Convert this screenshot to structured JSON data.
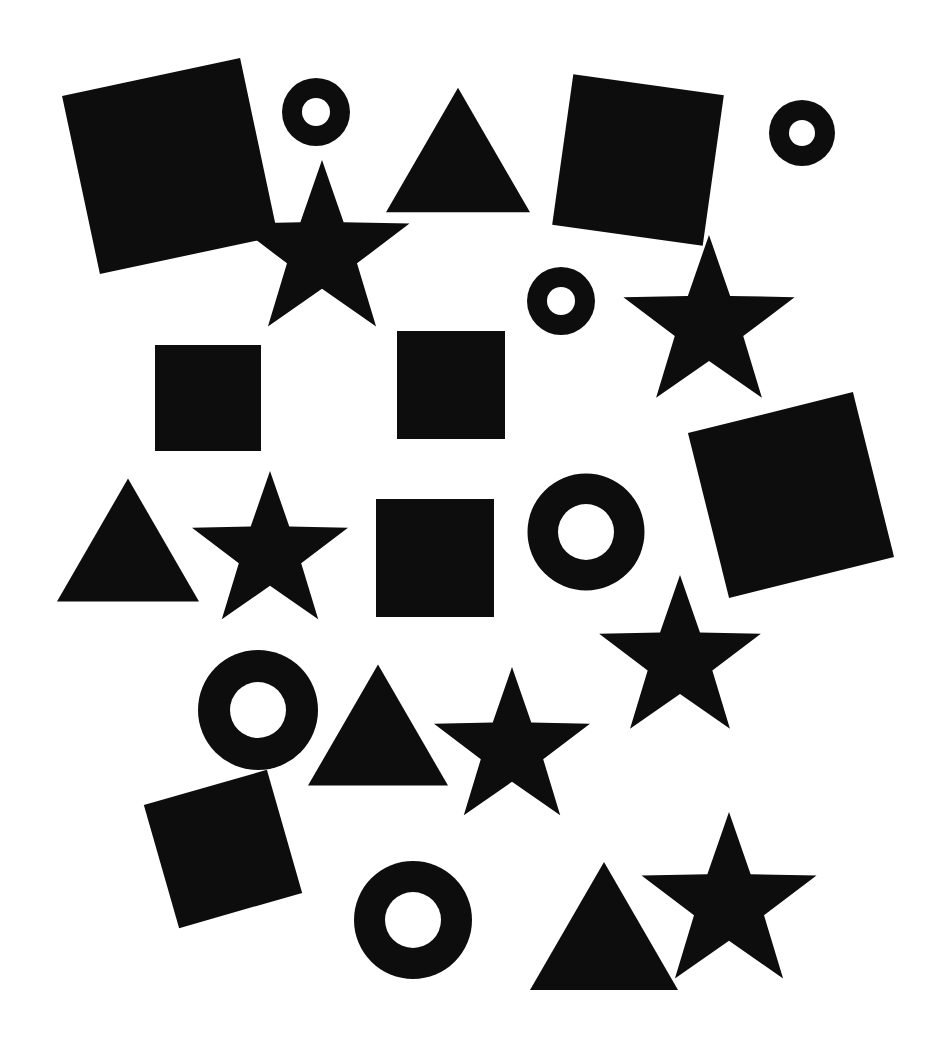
{
  "canvas": {
    "width": 936,
    "height": 1041,
    "background_color": "#ffffff",
    "shape_color": "#0d0d0d",
    "title": "Black geometric shapes on white background"
  },
  "legend": {
    "shape_kinds": [
      "square",
      "circle",
      "triangle",
      "star"
    ],
    "counts": {
      "square": 6,
      "circle": 6,
      "triangle": 4,
      "star": 6,
      "total": 22
    }
  },
  "shapes": [
    {
      "id": 1,
      "kind": "square",
      "label": "square-1",
      "cx": 170,
      "cy": 166,
      "size": 182,
      "rotation": -12,
      "color": "#0d0d0d"
    },
    {
      "id": 2,
      "kind": "circle",
      "label": "circle-1",
      "cx": 316,
      "cy": 112,
      "outer_d": 68,
      "inner_d": 28,
      "rotation": 0,
      "color": "#0d0d0d"
    },
    {
      "id": 3,
      "kind": "triangle",
      "label": "triangle-1",
      "cx": 458,
      "cy": 150,
      "size": 144,
      "rotation": 0,
      "color": "#0d0d0d"
    },
    {
      "id": 4,
      "kind": "square",
      "label": "square-2",
      "cx": 638,
      "cy": 160,
      "size": 152,
      "rotation": 8,
      "color": "#0d0d0d"
    },
    {
      "id": 5,
      "kind": "circle",
      "label": "circle-2",
      "cx": 802,
      "cy": 133,
      "outer_d": 66,
      "inner_d": 26,
      "rotation": 0,
      "color": "#0d0d0d"
    },
    {
      "id": 6,
      "kind": "star",
      "label": "star-1",
      "cx": 322,
      "cy": 252,
      "size": 92,
      "rotation": 0,
      "color": "#0d0d0d"
    },
    {
      "id": 7,
      "kind": "circle",
      "label": "circle-3",
      "cx": 561,
      "cy": 301,
      "outer_d": 68,
      "inner_d": 28,
      "rotation": 0,
      "color": "#0d0d0d"
    },
    {
      "id": 8,
      "kind": "star",
      "label": "star-2",
      "cx": 709,
      "cy": 325,
      "size": 90,
      "rotation": 0,
      "color": "#0d0d0d"
    },
    {
      "id": 9,
      "kind": "square",
      "label": "square-3",
      "cx": 208,
      "cy": 398,
      "size": 106,
      "rotation": 0,
      "color": "#0d0d0d"
    },
    {
      "id": 10,
      "kind": "square",
      "label": "square-4",
      "cx": 451,
      "cy": 385,
      "size": 108,
      "rotation": 0,
      "color": "#0d0d0d"
    },
    {
      "id": 11,
      "kind": "square",
      "label": "square-5",
      "cx": 791,
      "cy": 495,
      "size": 170,
      "rotation": -14,
      "color": "#0d0d0d"
    },
    {
      "id": 12,
      "kind": "triangle",
      "label": "triangle-2",
      "cx": 128,
      "cy": 540,
      "size": 142,
      "rotation": 0,
      "color": "#0d0d0d"
    },
    {
      "id": 13,
      "kind": "star",
      "label": "star-3",
      "cx": 270,
      "cy": 553,
      "size": 82,
      "rotation": 0,
      "color": "#0d0d0d"
    },
    {
      "id": 14,
      "kind": "square",
      "label": "square-6",
      "cx": 435,
      "cy": 558,
      "size": 118,
      "rotation": 0,
      "color": "#0d0d0d"
    },
    {
      "id": 15,
      "kind": "circle",
      "label": "circle-4",
      "cx": 586,
      "cy": 532,
      "outer_d": 117,
      "inner_d": 56,
      "rotation": 0,
      "color": "#0d0d0d"
    },
    {
      "id": 16,
      "kind": "star",
      "label": "star-4",
      "cx": 680,
      "cy": 660,
      "size": 85,
      "rotation": 0,
      "color": "#0d0d0d"
    },
    {
      "id": 17,
      "kind": "circle",
      "label": "circle-5",
      "cx": 258,
      "cy": 710,
      "outer_d": 120,
      "inner_d": 56,
      "rotation": 0,
      "color": "#0d0d0d"
    },
    {
      "id": 18,
      "kind": "triangle",
      "label": "triangle-3",
      "cx": 378,
      "cy": 725,
      "size": 140,
      "rotation": 0,
      "color": "#0d0d0d"
    },
    {
      "id": 19,
      "kind": "star",
      "label": "star-5",
      "cx": 512,
      "cy": 749,
      "size": 82,
      "rotation": 0,
      "color": "#0d0d0d"
    },
    {
      "id": 20,
      "kind": "square",
      "label": "square-7",
      "cx": 223,
      "cy": 849,
      "size": 128,
      "rotation": -16,
      "color": "#0d0d0d"
    },
    {
      "id": 21,
      "kind": "circle",
      "label": "circle-6",
      "cx": 413,
      "cy": 920,
      "outer_d": 118,
      "inner_d": 56,
      "rotation": 0,
      "color": "#0d0d0d"
    },
    {
      "id": 22,
      "kind": "triangle",
      "label": "triangle-4",
      "cx": 604,
      "cy": 926,
      "size": 148,
      "rotation": 0,
      "color": "#0d0d0d"
    },
    {
      "id": 23,
      "kind": "star",
      "label": "star-6",
      "cx": 729,
      "cy": 904,
      "size": 92,
      "rotation": 0,
      "color": "#0d0d0d"
    }
  ]
}
